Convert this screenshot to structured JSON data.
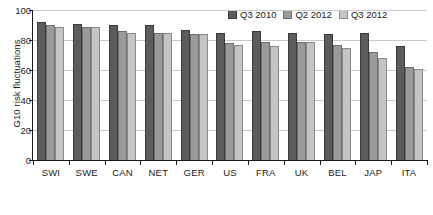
{
  "chart_data": {
    "type": "bar",
    "title": "",
    "xlabel": "",
    "ylabel": "G10 risk fluctuations",
    "ylim": [
      0,
      100
    ],
    "yticks": [
      0,
      20,
      40,
      60,
      80,
      100
    ],
    "grid": true,
    "legend_position": "top-right",
    "categories": [
      "SWI",
      "SWE",
      "CAN",
      "NET",
      "GER",
      "US",
      "FRA",
      "UK",
      "BEL",
      "JAP",
      "ITA"
    ],
    "series": [
      {
        "name": "Q3 2010",
        "color": "#5c5c5c",
        "values": [
          92,
          91,
          90,
          90,
          87,
          85,
          86,
          85,
          84,
          85,
          76
        ]
      },
      {
        "name": "Q2 2012",
        "color": "#9a9a9a",
        "values": [
          90,
          89,
          86,
          85,
          84,
          78,
          79,
          79,
          77,
          72,
          62
        ]
      },
      {
        "name": "Q3 2012",
        "color": "#c4c4c4",
        "values": [
          89,
          89,
          85,
          85,
          84,
          77,
          76,
          79,
          75,
          68,
          61
        ]
      }
    ]
  }
}
